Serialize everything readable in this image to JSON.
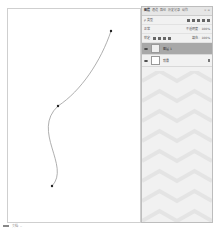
{
  "canvas": {
    "path": {
      "anchors": [
        {
          "x": 110,
          "y": 30
        },
        {
          "x": 57,
          "y": 105
        },
        {
          "x": 51,
          "y": 185
        }
      ],
      "stroke_color": "#9a9a9a"
    }
  },
  "layers_panel": {
    "tabs": [
      {
        "label": "图层",
        "active": true
      },
      {
        "label": "通道",
        "active": false
      },
      {
        "label": "路径",
        "active": false
      },
      {
        "label": "历史记录",
        "active": false
      },
      {
        "label": "动作",
        "active": false
      }
    ],
    "close_label": "× ≡",
    "filter_label": "ρ 类型",
    "blend_mode": "正常",
    "opacity_label": "不透明度:",
    "opacity_value": "100%",
    "lock_label": "锁定:",
    "fill_label": "填充:",
    "fill_value": "100%",
    "layers": [
      {
        "name": "图层 1",
        "selected": true,
        "locked": false
      },
      {
        "name": "背景",
        "selected": false,
        "locked": true
      }
    ]
  },
  "status_bar": {
    "zoom": "",
    "info": "文档: --"
  },
  "colors": {
    "selected_layer": "#a8a8a8",
    "panel_bg": "#f1f1f1"
  }
}
